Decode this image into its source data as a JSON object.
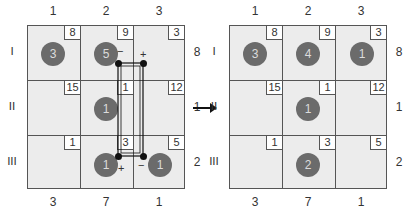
{
  "diagram": {
    "column_labels": [
      "1",
      "2",
      "3"
    ],
    "row_labels": [
      "I",
      "II",
      "III"
    ],
    "supply": [
      "8",
      "1",
      "2"
    ],
    "demand": [
      "3",
      "7",
      "1"
    ],
    "costs": [
      [
        "8",
        "9",
        "3"
      ],
      [
        "15",
        "1",
        "12"
      ],
      [
        "1",
        "3",
        "5"
      ]
    ],
    "left_tableau": {
      "allocations": [
        [
          "3",
          "5",
          ""
        ],
        [
          "",
          "1",
          ""
        ],
        [
          "",
          "1",
          "1"
        ]
      ],
      "path_signs": {
        "r0c1": "−",
        "r0c2": "+",
        "r2c1": "+",
        "r2c2": "−"
      }
    },
    "right_tableau": {
      "allocations": [
        [
          "3",
          "4",
          "1"
        ],
        [
          "",
          "1",
          ""
        ],
        [
          "",
          "2",
          ""
        ]
      ]
    },
    "arrow": "→",
    "colors": {
      "cell_bg": "#ececec",
      "allocation_circle": "#6b6b6b",
      "grid_line": "#555555",
      "path_line": "#111111"
    }
  }
}
